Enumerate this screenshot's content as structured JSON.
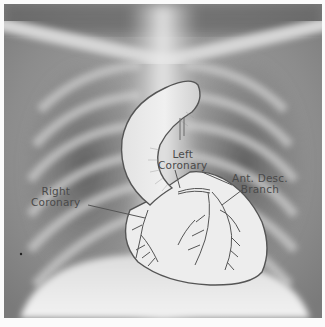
{
  "figure": {
    "type": "annotated chest x-ray with heart and coronary artery illustration",
    "background_colors": {
      "frame": "#fbfbfb",
      "xray_dark": "#5a5a5a",
      "xray_light": "#e6e6e6",
      "outline": "#555555"
    }
  },
  "labels": {
    "left_coronary": {
      "line1": "Left",
      "line2": "Coronary"
    },
    "ant_desc_branch": {
      "line1": "Ant. Desc.",
      "line2": "Branch"
    },
    "right_coronary": {
      "line1": "Right",
      "line2": "Coronary"
    }
  }
}
